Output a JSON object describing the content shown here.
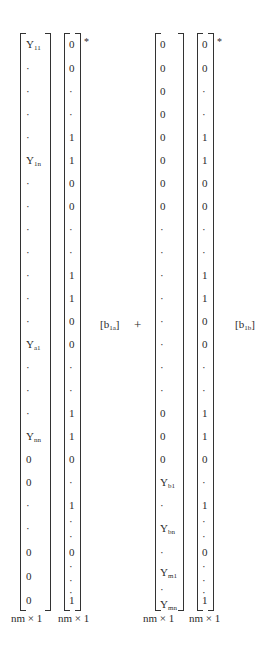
{
  "matrices": [
    {
      "id": "A",
      "entries": [
        "Y11",
        "·",
        "·",
        "·",
        "·",
        "Y1n",
        "·",
        "·",
        "·",
        "·",
        "·",
        "·",
        "·",
        "Ya1",
        "·",
        "·",
        "·",
        "Ynn",
        "0",
        "0",
        "·",
        "·",
        "0",
        "0",
        "0"
      ],
      "dim_label": "nm × 1"
    },
    {
      "id": "B",
      "entries": [
        "0",
        "0",
        "·",
        "·",
        "1",
        "1",
        "0",
        "0",
        "·",
        "·",
        "1",
        "1",
        "0",
        "0",
        "·",
        "·",
        "1",
        "1",
        "0",
        "·",
        "1",
        "·",
        "·",
        "0",
        "·",
        "·",
        "·",
        "1"
      ],
      "star": "*",
      "dim_label": "nm × 1"
    },
    {
      "id": "C",
      "entries": [
        "0",
        "0",
        "0",
        "0",
        "0",
        "0",
        "0",
        "0",
        "·",
        "·",
        "·",
        "·",
        "·",
        "·",
        "·",
        "·",
        "0",
        "0",
        "0",
        "Yb1",
        "·",
        "Ybn",
        "·",
        "Ym1",
        "·",
        "Ymn"
      ],
      "dim_label": "nm × 1"
    },
    {
      "id": "D",
      "entries": [
        "0",
        "0",
        "·",
        "·",
        "1",
        "1",
        "0",
        "0",
        "·",
        "·",
        "1",
        "1",
        "0",
        "0",
        "·",
        "·",
        "1",
        "1",
        "0",
        "·",
        "1",
        "·",
        "·",
        "0",
        "·",
        "·",
        "·",
        "1"
      ],
      "star": "*",
      "dim_label": "nm × 1"
    }
  ],
  "coeff_a": "[b1a]",
  "plus": "+",
  "coeff_b": "[b1b]",
  "labels": {
    "Y11": {
      "base": "Y",
      "sub": "11"
    },
    "Y1n": {
      "base": "Y",
      "sub": "1n"
    },
    "Ya1": {
      "base": "Y",
      "sub": "a1"
    },
    "Ynn": {
      "base": "Y",
      "sub": "nn"
    },
    "Yb1": {
      "base": "Y",
      "sub": "b1"
    },
    "Ybn": {
      "base": "Y",
      "sub": "bn"
    },
    "Ym1": {
      "base": "Y",
      "sub": "m1"
    },
    "Ymn": {
      "base": "Y",
      "sub": "mn"
    },
    "b1a": {
      "base": "b",
      "sub": "1a"
    },
    "b1b": {
      "base": "b",
      "sub": "1b"
    }
  }
}
